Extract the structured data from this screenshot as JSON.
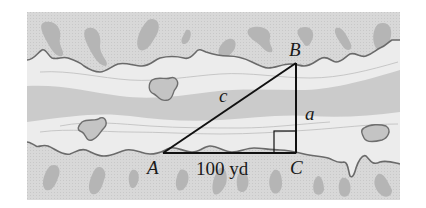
{
  "diagram": {
    "colors": {
      "land": "#dadada",
      "river_light": "#ececec",
      "river_band": "#cfcfcf",
      "shoreline": "#6e6e6e",
      "blob": "#b9b9b9",
      "triangle": "#111111"
    },
    "vertices": {
      "A": {
        "label": "A",
        "x": 163,
        "y": 153
      },
      "B": {
        "label": "B",
        "x": 296,
        "y": 63
      },
      "C": {
        "label": "C",
        "x": 296,
        "y": 153
      }
    },
    "sides": {
      "hypotenuse": {
        "label": "c",
        "from": "A",
        "to": "B"
      },
      "vertical": {
        "label": "a",
        "from": "C",
        "to": "B"
      },
      "base": {
        "label": "100 yd",
        "from": "A",
        "to": "C",
        "length": 100,
        "unit": "yd"
      }
    },
    "right_angle_at": "C"
  }
}
